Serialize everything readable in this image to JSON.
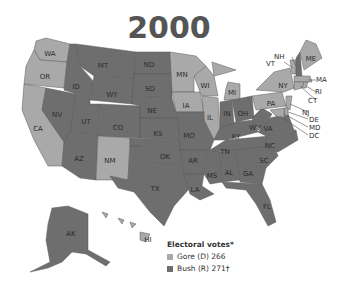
{
  "title": "2000",
  "colors": {
    "gore": "#a9a9a9",
    "bush": "#6e6e6e",
    "border": "#5a5a5a",
    "background": "#ffffff",
    "title": "#555555"
  },
  "legend": {
    "heading": "Electoral votes*",
    "items": [
      {
        "label": "Gore (D) 266",
        "party": "gore"
      },
      {
        "label": "Bush (R) 271†",
        "party": "bush"
      }
    ]
  },
  "states": {
    "WA": "WA",
    "OR": "OR",
    "CA": "CA",
    "NV": "NV",
    "ID": "ID",
    "MT": "MT",
    "WY": "WY",
    "UT": "UT",
    "AZ": "AZ",
    "CO": "CO",
    "NM": "NM",
    "ND": "ND",
    "SD": "SD",
    "NE": "NE",
    "KS": "KS",
    "OK": "OK",
    "TX": "TX",
    "MN": "MN",
    "IA": "IA",
    "MO": "MO",
    "AR": "AR",
    "LA": "LA",
    "WI": "WI",
    "IL": "IL",
    "MI": "MI",
    "IN": "IN",
    "OH": "OH",
    "KY": "KY",
    "TN": "TN",
    "MS": "MS",
    "AL": "AL",
    "GA": "GA",
    "FL": "FL",
    "SC": "SC",
    "NC": "NC",
    "VA": "VA",
    "WV": "WV",
    "PA": "PA",
    "NY": "NY",
    "ME": "ME",
    "AK": "AK",
    "HI": "HI",
    "NH": "NH",
    "VT": "VT",
    "MA": "MA",
    "RI": "RI",
    "CT": "CT",
    "NJ": "NJ",
    "DE": "DE",
    "MD": "MD",
    "DC": "DC"
  },
  "results": {
    "gore": [
      "WA",
      "OR",
      "CA",
      "NM",
      "MN",
      "IA",
      "WI",
      "IL",
      "MI",
      "PA",
      "NY",
      "VT",
      "MA",
      "RI",
      "CT",
      "NJ",
      "DE",
      "MD",
      "DC",
      "ME",
      "HI"
    ],
    "bush": [
      "NV",
      "ID",
      "MT",
      "WY",
      "UT",
      "AZ",
      "CO",
      "ND",
      "SD",
      "NE",
      "KS",
      "OK",
      "TX",
      "MO",
      "AR",
      "LA",
      "IN",
      "OH",
      "KY",
      "TN",
      "MS",
      "AL",
      "GA",
      "FL",
      "SC",
      "NC",
      "VA",
      "WV",
      "NH",
      "AK"
    ]
  }
}
